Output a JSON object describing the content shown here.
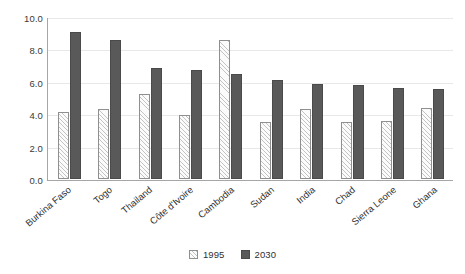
{
  "chart_data": {
    "type": "bar",
    "title": "",
    "subtitle": "",
    "xlabel": "",
    "ylabel": "",
    "ylim": [
      0,
      10
    ],
    "yticks": [
      "0.0",
      "2.0",
      "4.0",
      "6.0",
      "8.0",
      "10.0"
    ],
    "ytick_values": [
      0,
      2,
      4,
      6,
      8,
      10
    ],
    "grid": true,
    "legend_position": "bottom",
    "categories": [
      "Burkina Faso",
      "Togo",
      "Thailand",
      "Côte d'Ivoire",
      "Cambodia",
      "Sudan",
      "India",
      "Chad",
      "Sierra Leone",
      "Ghana"
    ],
    "series": [
      {
        "name": "1995",
        "color": "#fbfbfb",
        "values": [
          4.15,
          4.35,
          5.25,
          3.95,
          8.6,
          3.55,
          4.35,
          3.55,
          3.6,
          4.4
        ]
      },
      {
        "name": "2030",
        "color": "#595959",
        "values": [
          9.1,
          8.6,
          6.85,
          6.75,
          6.5,
          6.1,
          5.85,
          5.8,
          5.6,
          5.55
        ]
      }
    ]
  },
  "legend": {
    "entries": [
      {
        "label": "1995"
      },
      {
        "label": "2030"
      }
    ]
  }
}
